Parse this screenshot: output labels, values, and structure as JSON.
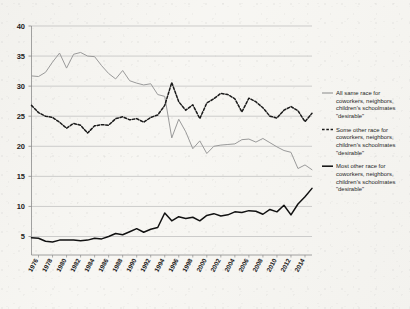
{
  "chart_data": {
    "type": "line",
    "title": "",
    "xlabel": "",
    "ylabel": "",
    "ylim": [
      0,
      40
    ],
    "yticks": [
      5,
      10,
      15,
      20,
      25,
      30,
      35,
      40
    ],
    "grid": true,
    "legend_position": "right",
    "x": [
      1975,
      1976,
      1977,
      1978,
      1979,
      1980,
      1981,
      1982,
      1983,
      1984,
      1985,
      1986,
      1987,
      1988,
      1989,
      1990,
      1991,
      1992,
      1993,
      1994,
      1995,
      1996,
      1997,
      1998,
      1999,
      2000,
      2001,
      2002,
      2003,
      2004,
      2005,
      2006,
      2007,
      2008,
      2009,
      2010,
      2011,
      2012,
      2013,
      2014,
      2015
    ],
    "xtick_labels": [
      "1976",
      "1978",
      "1980",
      "1982",
      "1984",
      "1986",
      "1988",
      "1990",
      "1992",
      "1994",
      "1996",
      "1998",
      "2000",
      "2002",
      "2004",
      "2006",
      "2008",
      "2010",
      "2012",
      "2014"
    ],
    "series": [
      {
        "name": "All same race for coworkers, neighbors, children's schoolmates \"desirable\"",
        "short_name": "all-same-race",
        "color": "#9a9a9a",
        "style": "solid",
        "values": [
          31.7,
          31.6,
          32.3,
          34.0,
          35.5,
          33.0,
          35.3,
          35.6,
          35.0,
          34.9,
          33.4,
          32.1,
          31.2,
          32.6,
          30.9,
          30.5,
          30.2,
          30.4,
          28.6,
          28.3,
          21.4,
          24.5,
          22.4,
          19.6,
          20.9,
          18.8,
          20.0,
          20.2,
          20.3,
          20.4,
          21.1,
          21.2,
          20.7,
          21.3,
          20.6,
          19.9,
          19.3,
          19.0,
          16.3,
          16.9,
          16.1
        ]
      },
      {
        "name": "Some other race for coworkers, neighbors, children's schoolmates \"desirable\"",
        "short_name": "some-other-race",
        "color": "#1a1a1a",
        "style": "dashed",
        "values": [
          26.8,
          25.6,
          25.0,
          24.8,
          24.0,
          23.0,
          23.8,
          23.5,
          22.2,
          23.4,
          23.6,
          23.5,
          24.6,
          24.9,
          24.4,
          24.6,
          24.0,
          24.8,
          25.2,
          26.8,
          30.6,
          27.4,
          26.0,
          26.9,
          24.6,
          27.2,
          27.9,
          28.8,
          28.6,
          27.9,
          25.7,
          28.0,
          27.4,
          26.4,
          25.0,
          24.7,
          26.0,
          26.6,
          25.9,
          24.1,
          25.5
        ]
      },
      {
        "name": "Most other race for coworkers, neighbors, children's schoolmates \"desirable\"",
        "short_name": "most-other-race",
        "color": "#111111",
        "style": "solid-thick",
        "values": [
          4.8,
          4.7,
          4.2,
          4.1,
          4.4,
          4.4,
          4.4,
          4.3,
          4.4,
          4.7,
          4.6,
          5.0,
          5.5,
          5.3,
          5.8,
          6.3,
          5.7,
          6.2,
          6.5,
          8.9,
          7.6,
          8.3,
          8.0,
          8.2,
          7.6,
          8.5,
          8.8,
          8.4,
          8.6,
          9.1,
          9.0,
          9.3,
          9.2,
          8.7,
          9.5,
          9.1,
          10.2,
          8.6,
          10.4,
          11.6,
          13.0
        ]
      }
    ]
  },
  "legend": {
    "items": [
      {
        "marker": "solid-gray",
        "lines": [
          "All same race for",
          "coworkers, neighbors,",
          "children's schoolmates",
          "\"desirable\""
        ]
      },
      {
        "marker": "dashed-black",
        "lines": [
          "Some other race for",
          "coworkers, neighbors,",
          "children's schoolmates",
          "\"desirable\""
        ]
      },
      {
        "marker": "solid-black",
        "lines": [
          "Most other race for",
          "coworkers, neighbors,",
          "children's schoolmates",
          "\"desirable\""
        ]
      }
    ]
  },
  "colors": {
    "background": "#f7f6f2",
    "grid": "#b9b9b9",
    "axis": "#8c8c8c",
    "series_gray": "#9a9a9a",
    "series_black": "#1a1a1a"
  }
}
